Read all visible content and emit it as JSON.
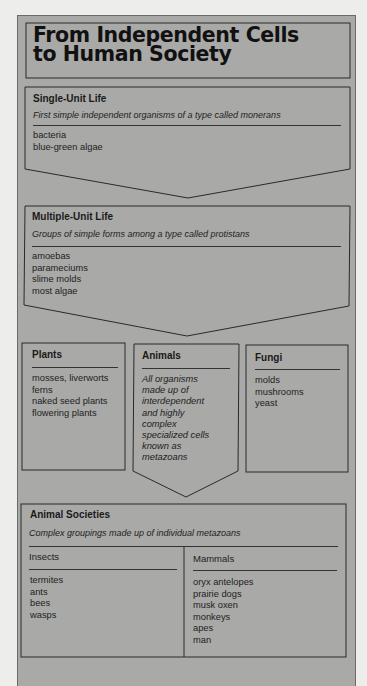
{
  "title": {
    "line1": "From Independent Cells",
    "line2": "to Human Society"
  },
  "single_unit": {
    "heading": "Single-Unit Life",
    "description": "First simple independent organisms of a type called monerans",
    "items": [
      "bacteria",
      "blue-green algae"
    ]
  },
  "multiple_unit": {
    "heading": "Multiple-Unit Life",
    "description": "Groups of simple forms among a type called protistans",
    "items": [
      "amoebas",
      "parameciums",
      "slime molds",
      "most algae"
    ]
  },
  "plants": {
    "heading": "Plants",
    "items": [
      "mosses, liverworts",
      "ferns",
      "naked seed plants",
      "flowering plants"
    ]
  },
  "animals": {
    "heading": "Animals",
    "description_lines": [
      "All organisms",
      "made up of",
      "interdependent",
      "and highly",
      "complex",
      "specialized cells",
      "known as",
      "metazoans"
    ]
  },
  "fungi": {
    "heading": "Fungi",
    "items": [
      "molds",
      "mushrooms",
      "yeast"
    ]
  },
  "animal_societies": {
    "heading": "Animal Societies",
    "description": "Complex groupings made up of individual metazoans",
    "insects": {
      "heading": "Insects",
      "items": [
        "termites",
        "ants",
        "bees",
        "wasps"
      ]
    },
    "mammals": {
      "heading": "Mammals",
      "items": [
        "oryx antelopes",
        "prairie dogs",
        "musk oxen",
        "monkeys",
        "apes",
        "man"
      ]
    }
  },
  "colors": {
    "background": "#ededeb",
    "panel": "#a9a9a7",
    "line": "#2a2a2a",
    "text": "#1a1a1a"
  }
}
